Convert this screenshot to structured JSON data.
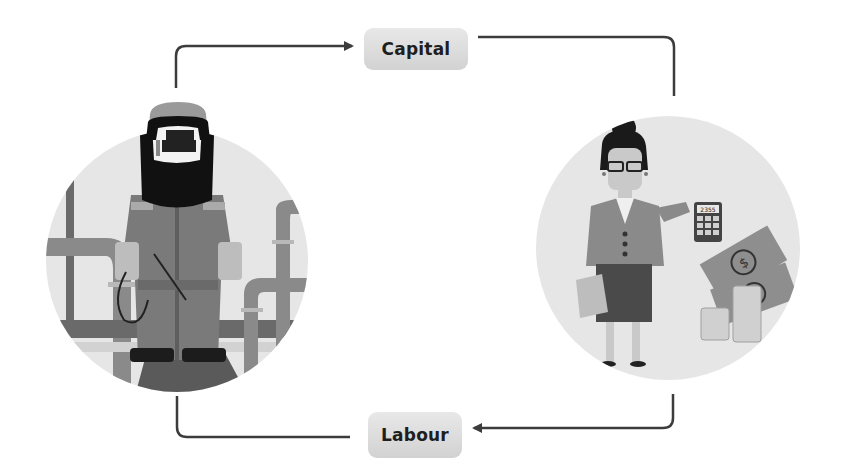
{
  "diagram": {
    "type": "circular-flow",
    "nodes": [
      {
        "id": "worker",
        "label": "",
        "description": "Welder worker illustration",
        "icon": "welder-worker-icon"
      },
      {
        "id": "businesswoman",
        "label": "",
        "description": "Businesswoman with calculator and money illustration",
        "icon": "businesswoman-money-icon"
      }
    ],
    "edges": [
      {
        "from": "worker",
        "to": "businesswoman",
        "label": "Capital"
      },
      {
        "from": "businesswoman",
        "to": "worker",
        "label": "Labour"
      }
    ],
    "labels": {
      "capital": "Capital",
      "labour": "Labour"
    },
    "calculator_display": "2355",
    "colors": {
      "arrow": "#3c3c3c",
      "label_bg": "#dcdcdc",
      "circle_bg": "#e6e6e6"
    }
  }
}
